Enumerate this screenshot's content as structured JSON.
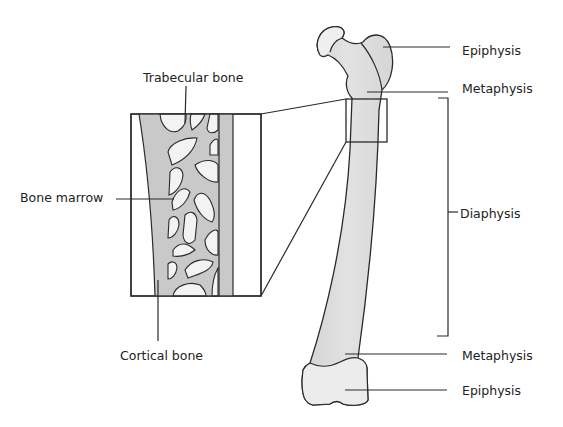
{
  "diagram": {
    "colors": {
      "bone_fill": "#dcdcdc",
      "head_fill": "#efefef",
      "trabecular_fill": "#c9c9c9",
      "marrow_fill": "#f3f3f3",
      "outline": "#2a2a2a",
      "text": "#222222"
    },
    "inset": {
      "labels": {
        "trabecular": "Trabecular bone",
        "marrow": "Bone marrow",
        "cortical": "Cortical bone"
      }
    },
    "femur": {
      "labels": {
        "epiphysis_top": "Epiphysis",
        "metaphysis_top": "Metaphysis",
        "diaphysis": "Diaphysis",
        "metaphysis_bottom": "Metaphysis",
        "epiphysis_bottom": "Epiphysis"
      }
    }
  }
}
